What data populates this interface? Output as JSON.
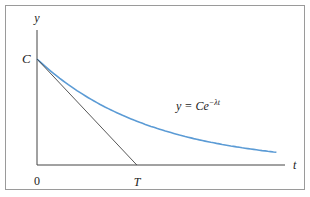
{
  "chart_data": {
    "type": "line",
    "title": "",
    "xlabel": "t",
    "ylabel": "y",
    "x_ticks": [
      "0",
      "T"
    ],
    "y_ticks": [
      "C"
    ],
    "series": [
      {
        "name": "y = Ce^{-λt}",
        "function": "exponential decay",
        "color": "#5b9bd5",
        "x": [
          0,
          0.5,
          1,
          1.5,
          2,
          2.5,
          3,
          3.5,
          4.2
        ],
        "y": [
          1,
          0.78,
          0.6,
          0.47,
          0.37,
          0.29,
          0.22,
          0.17,
          0.12
        ]
      },
      {
        "name": "tangent at t=0",
        "color": "#444444",
        "x": [
          0,
          1.75
        ],
        "y": [
          1,
          0
        ]
      }
    ],
    "annotations": {
      "curve_label_prefix": "y = Ce",
      "curve_label_exponent": "−λt",
      "origin": "0",
      "intercept": "T",
      "initial_value": "C"
    }
  }
}
